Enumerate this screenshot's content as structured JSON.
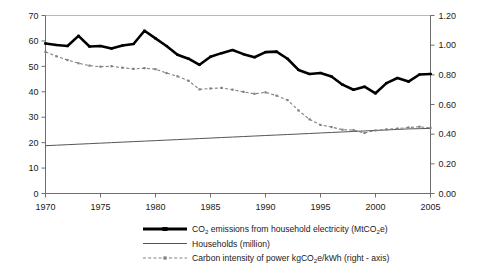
{
  "chart_data": {
    "type": "line",
    "title": "",
    "xlabel": "",
    "ylabel": "",
    "grid": false,
    "legend_position": "bottom",
    "x": [
      1970,
      1971,
      1972,
      1973,
      1974,
      1975,
      1976,
      1977,
      1978,
      1979,
      1980,
      1981,
      1982,
      1983,
      1984,
      1985,
      1986,
      1987,
      1988,
      1989,
      1990,
      1991,
      1992,
      1993,
      1994,
      1995,
      1996,
      1997,
      1998,
      1999,
      2000,
      2001,
      2002,
      2003,
      2004,
      2005
    ],
    "x_tick_labels": [
      "1970",
      "1975",
      "1980",
      "1985",
      "1990",
      "1995",
      "2000",
      "2005"
    ],
    "x_ticks": [
      1970,
      1975,
      1980,
      1985,
      1990,
      1995,
      2000,
      2005
    ],
    "xlim": [
      1970,
      2005
    ],
    "left_axis": {
      "label": "",
      "ylim": [
        0,
        70
      ],
      "ticks": [
        0,
        10,
        20,
        30,
        40,
        50,
        60,
        70
      ],
      "tick_labels": [
        "0",
        "10",
        "20",
        "30",
        "40",
        "50",
        "60",
        "70"
      ]
    },
    "right_axis": {
      "label": "",
      "ylim": [
        0.0,
        1.2
      ],
      "ticks": [
        0.0,
        0.2,
        0.4,
        0.6,
        0.8,
        1.0,
        1.2
      ],
      "tick_labels": [
        "0.00",
        "0.20",
        "0.40",
        "0.60",
        "0.80",
        "1.00",
        "1.20"
      ]
    },
    "series": [
      {
        "name": "CO2 emissions from household electricity (MtCO2e)",
        "axis": "left",
        "style": "thick-solid-with-markers",
        "color": "#000000",
        "values": [
          59.0,
          58.4,
          58.0,
          62.0,
          57.8,
          58.0,
          57.0,
          58.2,
          58.8,
          64.0,
          61.0,
          58.0,
          54.6,
          53.0,
          50.6,
          53.8,
          55.2,
          56.4,
          54.8,
          53.6,
          55.6,
          55.8,
          53.0,
          48.6,
          47.0,
          47.4,
          46.0,
          42.8,
          40.8,
          42.0,
          39.4,
          43.4,
          45.4,
          44.0,
          46.8,
          47.0
        ]
      },
      {
        "name": "Households (million)",
        "axis": "left",
        "style": "thin-solid",
        "color": "#555555",
        "values": [
          18.8,
          19.0,
          19.2,
          19.4,
          19.6,
          19.8,
          20.0,
          20.2,
          20.4,
          20.6,
          20.8,
          21.0,
          21.2,
          21.4,
          21.6,
          21.8,
          22.0,
          22.2,
          22.4,
          22.6,
          22.8,
          23.0,
          23.2,
          23.4,
          23.6,
          23.8,
          24.0,
          24.2,
          24.4,
          24.6,
          24.8,
          25.0,
          25.2,
          25.4,
          25.5,
          25.6
        ]
      },
      {
        "name": "Carbon intensity of power kgCO2e/kWh (right - axis)",
        "axis": "right",
        "style": "dashed-dot-with-markers",
        "color": "#808080",
        "values": [
          0.955,
          0.925,
          0.9,
          0.878,
          0.862,
          0.855,
          0.858,
          0.848,
          0.84,
          0.845,
          0.838,
          0.812,
          0.79,
          0.76,
          0.702,
          0.708,
          0.712,
          0.7,
          0.685,
          0.672,
          0.682,
          0.66,
          0.63,
          0.56,
          0.5,
          0.462,
          0.448,
          0.43,
          0.428,
          0.408,
          0.425,
          0.432,
          0.438,
          0.445,
          0.45,
          0.442
        ]
      }
    ]
  },
  "legend": {
    "items": [
      {
        "key": "co2-emissions",
        "marker": "thick-line-marker",
        "text_pre": "CO",
        "text_sub1": "2",
        "text_mid": " emissions from household electricity (MtCO",
        "text_sub2": "2",
        "text_post": "e)"
      },
      {
        "key": "households",
        "marker": "thin-line",
        "text_pre": "Households (million)",
        "text_sub1": "",
        "text_mid": "",
        "text_sub2": "",
        "text_post": ""
      },
      {
        "key": "carbon-intensity",
        "marker": "dashed-line-marker",
        "text_pre": "Carbon intensity of power kgCO",
        "text_sub1": "2",
        "text_mid": "e/kWh (right - axis)",
        "text_sub2": "",
        "text_post": ""
      }
    ]
  }
}
